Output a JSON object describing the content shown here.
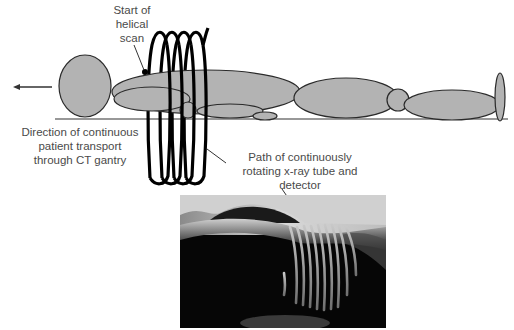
{
  "figure": {
    "labels": {
      "start_of_scan": [
        "Start of",
        "helical",
        "scan"
      ],
      "direction": [
        "Direction of continuous",
        "patient transport",
        "through CT gantry"
      ],
      "path": [
        "Path of continuously",
        "rotating x-ray tube and",
        "detector"
      ]
    },
    "colors": {
      "body_fill": "#b3b3b3",
      "body_stroke": "#2a2a2a",
      "helix_stroke": "#000000",
      "text": "#4a4a4a",
      "background": "#ffffff"
    },
    "helix": {
      "coil_count": 5
    },
    "photo": {
      "description": "Photograph of patient torso with projected helical light stripes",
      "stripe_count": 9
    }
  }
}
